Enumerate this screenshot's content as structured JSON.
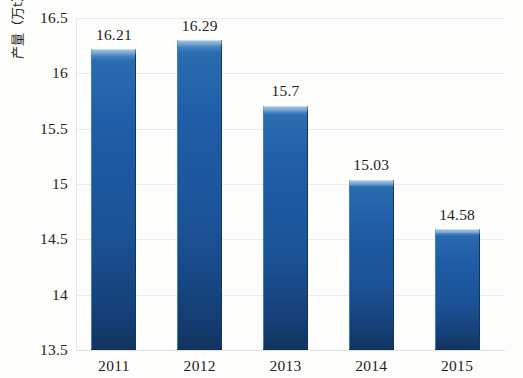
{
  "chart_data": {
    "type": "bar",
    "title": "",
    "xlabel": "",
    "ylabel": "产量（万t）",
    "categories": [
      "2011",
      "2012",
      "2013",
      "2014",
      "2015"
    ],
    "values": [
      16.21,
      16.29,
      15.7,
      15.03,
      14.58
    ],
    "value_labels": [
      "16.21",
      "16.29",
      "15.7",
      "15.03",
      "14.58"
    ],
    "ylim": [
      13.5,
      16.5
    ],
    "y_ticks": [
      13.5,
      14,
      14.5,
      15,
      15.5,
      16,
      16.5
    ],
    "y_tick_labels": [
      "13.5",
      "14",
      "14.5",
      "15",
      "15.5",
      "16",
      "16.5"
    ],
    "grid": true,
    "legend": "none",
    "series_color": "#1f5da6",
    "bar_top_highlight": "#9fc4e4",
    "bar_bottom_shade": "#12355f",
    "gridline_color": "#e9ecef",
    "text_color": "#231f20",
    "background": "#fdfdfc"
  }
}
